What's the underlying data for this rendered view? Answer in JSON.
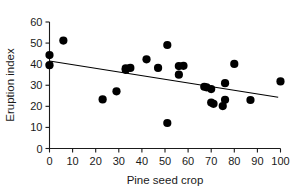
{
  "chart_data": {
    "type": "scatter",
    "title": "",
    "xlabel": "Pine seed crop",
    "ylabel": "Eruption index",
    "xlim": [
      0,
      100
    ],
    "ylim": [
      0,
      60
    ],
    "xticks": [
      0,
      10,
      20,
      30,
      40,
      50,
      60,
      70,
      80,
      90,
      100
    ],
    "yticks": [
      0,
      10,
      20,
      30,
      40,
      50,
      60
    ],
    "grid": false,
    "legend": null,
    "marker": {
      "shape": "circle",
      "color": "#000000",
      "size": 4.1
    },
    "points": [
      {
        "x": 0,
        "y": 39.5
      },
      {
        "x": 0,
        "y": 44.3
      },
      {
        "x": 6,
        "y": 51.2
      },
      {
        "x": 23,
        "y": 23.3
      },
      {
        "x": 29,
        "y": 27.1
      },
      {
        "x": 33,
        "y": 37.3
      },
      {
        "x": 33,
        "y": 38.0
      },
      {
        "x": 35,
        "y": 38.2
      },
      {
        "x": 42,
        "y": 42.3
      },
      {
        "x": 47,
        "y": 38.2
      },
      {
        "x": 51,
        "y": 12.1
      },
      {
        "x": 51,
        "y": 49.1
      },
      {
        "x": 56,
        "y": 35.0
      },
      {
        "x": 56,
        "y": 39.1
      },
      {
        "x": 58,
        "y": 39.2
      },
      {
        "x": 67,
        "y": 29.3
      },
      {
        "x": 68,
        "y": 29.0
      },
      {
        "x": 70,
        "y": 28.2
      },
      {
        "x": 70,
        "y": 21.8
      },
      {
        "x": 71,
        "y": 21.2
      },
      {
        "x": 75,
        "y": 20.1
      },
      {
        "x": 76,
        "y": 23.1
      },
      {
        "x": 76,
        "y": 31.0
      },
      {
        "x": 80,
        "y": 40.1
      },
      {
        "x": 87,
        "y": 23.0
      },
      {
        "x": 100,
        "y": 31.8
      }
    ],
    "fit_line": {
      "name": "linear-regression",
      "x_start": 0,
      "y_start": 41.5,
      "x_end": 99,
      "y_end": 24.3,
      "color": "#000000"
    }
  },
  "axes": {
    "x_tick_labels": [
      "0",
      "10",
      "20",
      "30",
      "40",
      "50",
      "60",
      "70",
      "80",
      "90",
      "100"
    ],
    "y_tick_labels": [
      "0",
      "10",
      "20",
      "30",
      "40",
      "50",
      "60"
    ],
    "x_axis_title": "Pine seed crop",
    "y_axis_title": "Eruption index"
  }
}
